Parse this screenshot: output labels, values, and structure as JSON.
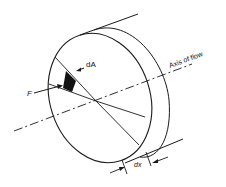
{
  "diagram": {
    "title": "",
    "type": "technical-illustration",
    "labels": {
      "area_element": "dA",
      "force": "F",
      "axis": "Axis of flow",
      "thickness": "dx"
    },
    "colors": {
      "stroke": "#1a1a1a",
      "fill_shaded": "#111111",
      "background": "#ffffff"
    }
  }
}
